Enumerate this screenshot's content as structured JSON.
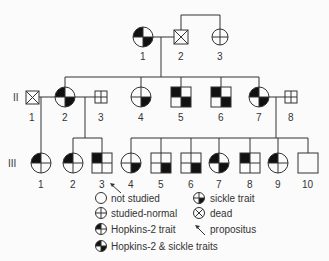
{
  "generations": [
    {
      "label": "I",
      "members": [
        {
          "id": "I-1",
          "number": "1",
          "sex": "female",
          "status": "hopkins2-and-sickle"
        },
        {
          "id": "I-2",
          "number": "2",
          "sex": "male",
          "status": "dead"
        },
        {
          "id": "I-3",
          "number": "3",
          "sex": "female",
          "status": "studied-normal"
        }
      ]
    },
    {
      "label": "II",
      "members": [
        {
          "id": "II-1",
          "number": "1",
          "sex": "male",
          "status": "dead"
        },
        {
          "id": "II-2",
          "number": "2",
          "sex": "female",
          "status": "hopkins2-and-sickle"
        },
        {
          "id": "II-3",
          "number": "3",
          "sex": "male",
          "status": "studied-normal"
        },
        {
          "id": "II-4",
          "number": "4",
          "sex": "female",
          "status": "sickle-trait"
        },
        {
          "id": "II-5",
          "number": "5",
          "sex": "male",
          "status": "hopkins2-and-sickle"
        },
        {
          "id": "II-6",
          "number": "6",
          "sex": "male",
          "status": "hopkins2-and-sickle"
        },
        {
          "id": "II-7",
          "number": "7",
          "sex": "female",
          "status": "hopkins2-and-sickle"
        },
        {
          "id": "II-8",
          "number": "8",
          "sex": "male",
          "status": "studied-normal"
        }
      ]
    },
    {
      "label": "III",
      "members": [
        {
          "id": "III-1",
          "number": "1",
          "sex": "female",
          "status": "hopkins2-trait"
        },
        {
          "id": "III-2",
          "number": "2",
          "sex": "female",
          "status": "hopkins2-trait"
        },
        {
          "id": "III-3",
          "number": "3",
          "sex": "male",
          "status": "hopkins2-trait",
          "propositus": true
        },
        {
          "id": "III-4",
          "number": "4",
          "sex": "female",
          "status": "sickle-trait"
        },
        {
          "id": "III-5",
          "number": "5",
          "sex": "male",
          "status": "sickle-trait"
        },
        {
          "id": "III-6",
          "number": "6",
          "sex": "male",
          "status": "sickle-trait"
        },
        {
          "id": "III-7",
          "number": "7",
          "sex": "female",
          "status": "hopkins2-and-sickle"
        },
        {
          "id": "III-8",
          "number": "8",
          "sex": "male",
          "status": "hopkins2-trait"
        },
        {
          "id": "III-9",
          "number": "9",
          "sex": "female",
          "status": "hopkins2-trait"
        },
        {
          "id": "III-10",
          "number": "10",
          "sex": "male",
          "status": "not-studied"
        }
      ]
    }
  ],
  "legend": {
    "not_studied": "not studied",
    "studied_normal": "studied-normal",
    "hopkins2_trait": "Hopkins-2 trait",
    "hopkins2_and_sickle": "Hopkins-2 & sickle traits",
    "sickle_trait": "sickle trait",
    "dead": "dead",
    "propositus": "propositus"
  },
  "colors": {
    "line": "#333333",
    "fill": "#111111",
    "background": "#fbfbfb"
  }
}
